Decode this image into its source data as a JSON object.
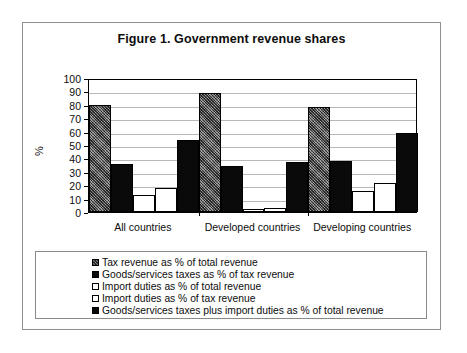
{
  "figure": {
    "title": "Figure 1. Government revenue shares"
  },
  "chart_data": {
    "type": "bar",
    "title": "Figure 1. Government revenue shares",
    "xlabel": "",
    "ylabel": "%",
    "ylim": [
      0,
      100
    ],
    "ytick_step": 10,
    "yticks": [
      100,
      90,
      80,
      70,
      60,
      50,
      40,
      30,
      20,
      10,
      0
    ],
    "grid": true,
    "legend_position": "bottom",
    "categories": [
      "All countries",
      "Developed countries",
      "Developing countries"
    ],
    "series": [
      {
        "name": "Tax revenue as % of total revenue",
        "swatch": "textured-gray",
        "values": [
          80,
          89,
          78
        ]
      },
      {
        "name": "Goods/services taxes as % of tax revenue",
        "swatch": "solid-black",
        "values": [
          36,
          34,
          38
        ]
      },
      {
        "name": "Import duties as % of total revenue",
        "swatch": "white-outline",
        "values": [
          13,
          2,
          16
        ]
      },
      {
        "name": "Import duties as % of tax revenue",
        "swatch": "white-outline",
        "values": [
          18,
          3,
          22
        ]
      },
      {
        "name": "Goods/services taxes plus import  duties as % of total revenue",
        "swatch": "solid-black",
        "values": [
          54,
          37,
          59
        ]
      }
    ]
  },
  "legend": {
    "items": [
      {
        "label": "Tax revenue as % of total revenue",
        "swatch": "textured-gray"
      },
      {
        "label": "Goods/services taxes as % of tax revenue",
        "swatch": "solid-black"
      },
      {
        "label": "Import duties as % of total revenue",
        "swatch": "white-outline"
      },
      {
        "label": "Import duties as % of tax revenue",
        "swatch": "white-outline"
      },
      {
        "label": "Goods/services taxes plus import  duties as % of total revenue",
        "swatch": "solid-black"
      }
    ]
  }
}
